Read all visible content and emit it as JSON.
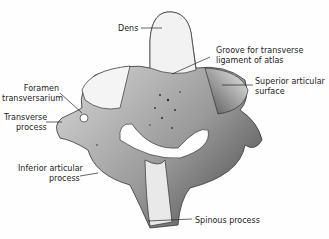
{
  "figure": {
    "labels": {
      "dens": "Dens",
      "groove_line1": "Groove for transverse",
      "groove_line2": "ligament of atlas",
      "superior_line1": "Superior articular",
      "superior_line2": "surface",
      "foramen_line1": "Foramen",
      "foramen_line2": "transversarium",
      "transverse_line1": "Transverse",
      "transverse_line2": "process",
      "inferior_line1": "Inferior articular",
      "inferior_line2": "process",
      "spinous": "Spinous process"
    }
  }
}
